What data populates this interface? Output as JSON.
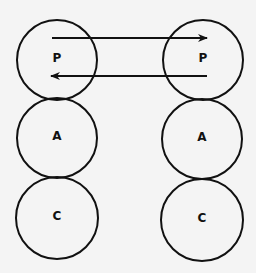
{
  "diagram": {
    "background": "#f4f4f4",
    "stroke_color": "#111111",
    "left_column": {
      "nodes": [
        {
          "id": "left-p",
          "label": "P",
          "cx": 57,
          "cy": 60,
          "r": 40
        },
        {
          "id": "left-a",
          "label": "A",
          "cx": 57,
          "cy": 138,
          "r": 40
        },
        {
          "id": "left-c",
          "label": "C",
          "cx": 57,
          "cy": 218,
          "r": 41
        }
      ]
    },
    "right_column": {
      "nodes": [
        {
          "id": "right-p",
          "label": "P",
          "cx": 203,
          "cy": 60,
          "r": 40
        },
        {
          "id": "right-a",
          "label": "A",
          "cx": 202,
          "cy": 139,
          "r": 40
        },
        {
          "id": "right-c",
          "label": "C",
          "cx": 202,
          "cy": 220,
          "r": 41
        }
      ]
    },
    "arrows": [
      {
        "id": "arrow-left-p-to-right-p",
        "from": "left-p",
        "to": "right-p",
        "x1": 52,
        "y1": 38,
        "x2": 207,
        "y2": 38,
        "direction": "right"
      },
      {
        "id": "arrow-right-p-to-left-p",
        "from": "right-p",
        "to": "left-p",
        "x1": 207,
        "y1": 76,
        "x2": 51,
        "y2": 76,
        "direction": "left"
      }
    ]
  }
}
